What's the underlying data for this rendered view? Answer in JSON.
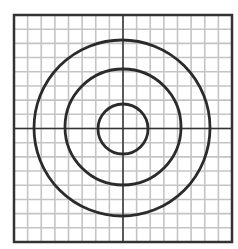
{
  "figure": {
    "grid": {
      "cols": 16,
      "rows": 16,
      "x0": 14,
      "y0": 15,
      "x1": 232,
      "y1": 242,
      "line_color": "#c4c4c4",
      "border_color": "#333333"
    },
    "axes": {
      "center_x": 123,
      "center_y": 128.5,
      "color": "#333333"
    },
    "circles": [
      {
        "name": "inner",
        "cx": 123,
        "cy": 129,
        "r": 25
      },
      {
        "name": "middle",
        "cx": 123,
        "cy": 127,
        "r": 58
      },
      {
        "name": "outer",
        "cx": 122,
        "cy": 128,
        "r": 88
      }
    ],
    "circle_color": "#2b2b2b"
  }
}
